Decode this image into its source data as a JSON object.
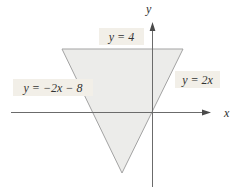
{
  "figure": {
    "type": "math-region-diagram",
    "background_color": "#ffffff",
    "region": {
      "shape": "triangle",
      "fill_color": "#ececea",
      "stroke_color": "#a3a3a3",
      "vertices_xy": [
        [
          -6,
          4
        ],
        [
          2,
          4
        ],
        [
          -2,
          -4
        ]
      ]
    },
    "boundary_lines": [
      {
        "equation": "y = 4",
        "position": "top"
      },
      {
        "equation": "y = −2x − 8",
        "position": "left"
      },
      {
        "equation": "y = 2x",
        "position": "right"
      }
    ],
    "axes": {
      "x_label": "x",
      "y_label": "y",
      "color": "#6b6b6b",
      "ticks": "none"
    },
    "labels": {
      "top": "y = 4",
      "left": "y = −2x − 8",
      "right": "y = 2x",
      "box_color": "#f2efe8",
      "text_color": "#333333"
    }
  }
}
